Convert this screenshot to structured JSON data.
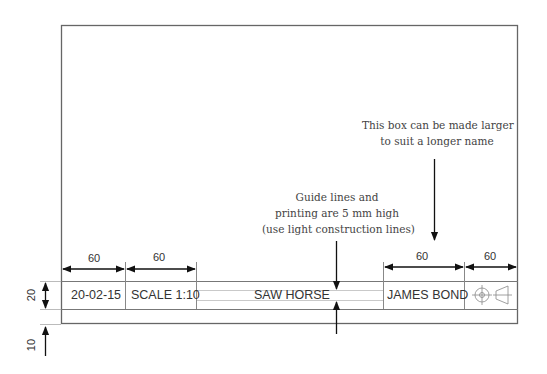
{
  "title_block": {
    "date": "20-02-15",
    "scale": "SCALE 1:10",
    "title": "SAW HORSE",
    "name": "JAMES BOND",
    "projection_symbol": "third-angle-projection-icon"
  },
  "dimensions": {
    "date_width": "60",
    "scale_width": "60",
    "name_width": "60",
    "symbol_width": "60",
    "block_height": "20",
    "border_margin": "10"
  },
  "annotations": {
    "name_box_note_line1": "This box can be made larger",
    "name_box_note_line2": "to suit a longer name",
    "guide_note_line1": "Guide lines and",
    "guide_note_line2": "printing are 5 mm high",
    "guide_note_line3": "(use light construction lines)"
  },
  "colors": {
    "line": "#555555",
    "light_line": "#aaaaaa",
    "arrow": "#111111"
  }
}
